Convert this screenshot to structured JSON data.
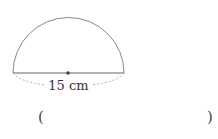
{
  "figure": {
    "shape": "semicircle",
    "diameter_label": "15 cm",
    "center_dot": true
  },
  "answer": {
    "open_paren": "(",
    "close_paren": ")",
    "value": ""
  },
  "colors": {
    "stroke": "#777777",
    "dash": "#999999",
    "text": "#333333"
  }
}
